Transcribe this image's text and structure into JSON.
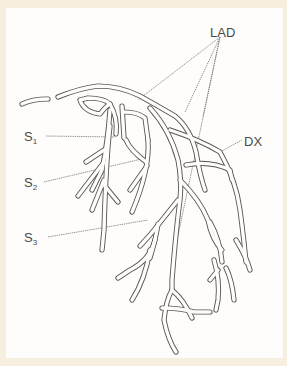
{
  "diagram": {
    "labels": {
      "lad": "LAD",
      "dx": "DX",
      "s1_main": "S",
      "s1_sub": "1",
      "s2_main": "S",
      "s2_sub": "2",
      "s3_main": "S",
      "s3_sub": "3"
    },
    "colors": {
      "background": "#f6efe0",
      "panel": "#fefdfb",
      "line": "#555555",
      "text": "#4a4a4a"
    }
  }
}
